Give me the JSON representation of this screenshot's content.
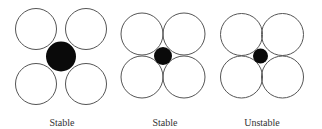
{
  "diagram": {
    "colors": {
      "outline": "#555555",
      "fill_small": "#0a0a0a",
      "background": "#ffffff",
      "label": "#333333"
    },
    "panels": [
      {
        "label": "Stable",
        "large_radius": 20.5,
        "large_centers": [
          [
            36,
            29
          ],
          [
            86,
            29
          ],
          [
            36,
            84
          ],
          [
            86,
            84
          ]
        ],
        "small_center": [
          61,
          56.5
        ],
        "small_radius": 15,
        "label_x": 62
      },
      {
        "label": "Stable",
        "large_radius": 21,
        "large_centers": [
          [
            142,
            34
          ],
          [
            184,
            34
          ],
          [
            142,
            77
          ],
          [
            184,
            77
          ]
        ],
        "small_center": [
          163,
          56
        ],
        "small_radius": 9,
        "label_x": 165
      },
      {
        "label": "Unstable",
        "large_radius": 21,
        "large_centers": [
          [
            241.5,
            34.5
          ],
          [
            282.5,
            34.5
          ],
          [
            241.5,
            77
          ],
          [
            282.5,
            77
          ]
        ],
        "small_center": [
          260.5,
          56
        ],
        "small_radius": 7.5,
        "label_x": 262
      }
    ]
  }
}
